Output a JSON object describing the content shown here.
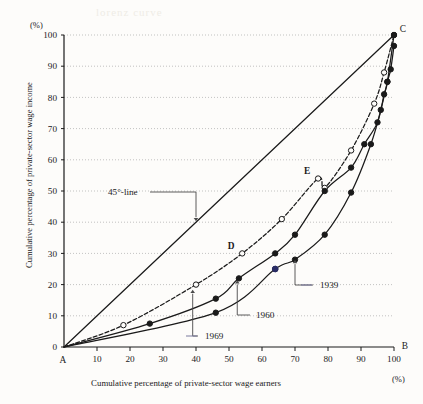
{
  "figure": {
    "y_axis_unit": "(%)",
    "x_axis_unit": "(%)",
    "y_axis_title": "Cumulative percentage of private-sector wage income",
    "x_axis_title": "Cumulative percentage of private-sector wage earners",
    "bleed_through_text": "lorenz curve"
  },
  "chart_data": {
    "type": "line",
    "title": "",
    "xlabel": "Cumulative percentage of private-sector wage earners",
    "ylabel": "Cumulative percentage of private-sector wage income",
    "xunit": "(%)",
    "yunit": "(%)",
    "xlim": [
      0,
      100
    ],
    "ylim": [
      0,
      100
    ],
    "xticks": [
      0,
      10,
      20,
      30,
      40,
      50,
      60,
      70,
      80,
      90,
      100
    ],
    "yticks": [
      0,
      10,
      20,
      30,
      40,
      50,
      60,
      70,
      80,
      90,
      100
    ],
    "xticklabels": [
      "0",
      "10",
      "20",
      "30",
      "40",
      "50",
      "60",
      "70",
      "80",
      "90",
      "100"
    ],
    "yticklabels": [
      "0",
      "10",
      "20",
      "30",
      "40",
      "50",
      "60",
      "70",
      "80",
      "90",
      "100"
    ],
    "grid": "horizontal-dotted",
    "legend": "inline-annotations",
    "shaded_region": {
      "label": "area between 45-degree line and 1969 Lorenz curve",
      "color": "#a8a8a8",
      "between": [
        "45-line",
        "1969"
      ]
    },
    "series": [
      {
        "name": "45°-line",
        "style": "solid",
        "marker": "none",
        "color": "#1a1a1a",
        "x": [
          0,
          100
        ],
        "y": [
          0,
          100
        ]
      },
      {
        "name": "1969",
        "style": "dashed",
        "marker": "open-circle",
        "color": "#1a1a1a",
        "x": [
          0,
          18,
          40,
          54,
          66,
          77,
          79,
          87,
          94,
          97,
          100
        ],
        "y": [
          0,
          7,
          20,
          30,
          41,
          54,
          51,
          63,
          78,
          88,
          100
        ]
      },
      {
        "name": "1960",
        "style": "solid",
        "marker": "filled-circle",
        "color": "#1a1a1a",
        "x": [
          0,
          26,
          46,
          53,
          64,
          70,
          79,
          87,
          91,
          95,
          97,
          98,
          100
        ],
        "y": [
          0,
          7.5,
          15.5,
          22,
          30,
          36,
          50,
          57.5,
          65,
          72,
          81,
          85,
          100
        ]
      },
      {
        "name": "1939",
        "style": "solid",
        "marker": "filled-circle",
        "color": "#1a1a1a",
        "x": [
          0,
          46,
          64,
          70,
          79,
          87,
          93,
          96,
          98,
          99,
          100
        ],
        "y": [
          0,
          11,
          25,
          28,
          36,
          49.5,
          65,
          76,
          85,
          89,
          96.5
        ]
      }
    ],
    "annotations": [
      {
        "name": "corner-a",
        "text": "A",
        "x": 0,
        "y": 0,
        "kind": "corner"
      },
      {
        "name": "corner-b",
        "text": "B",
        "x": 100,
        "y": 0,
        "kind": "corner"
      },
      {
        "name": "corner-c",
        "text": "C",
        "x": 100,
        "y": 100,
        "kind": "corner"
      },
      {
        "name": "point-d",
        "text": "D",
        "x": 54,
        "y": 30,
        "kind": "point-label"
      },
      {
        "name": "point-e",
        "text": "E",
        "x": 77,
        "y": 54,
        "kind": "point-label"
      },
      {
        "name": "callout-45-line",
        "text": "45°-line",
        "kind": "callout",
        "target_x": 40,
        "target_y": 40
      },
      {
        "name": "callout-1969",
        "text": "1969",
        "kind": "callout",
        "target_x": 39,
        "target_y": 19
      },
      {
        "name": "callout-1960",
        "text": "1960",
        "kind": "callout",
        "target_x": 52.5,
        "target_y": 22
      },
      {
        "name": "callout-1939",
        "text": "1939",
        "kind": "callout",
        "target_x": 70,
        "target_y": 28.5
      }
    ],
    "special_markers": [
      {
        "name": "marker-1939-highlight",
        "x": 64,
        "y": 25,
        "color": "#2a2d66",
        "series": "1939"
      }
    ]
  }
}
